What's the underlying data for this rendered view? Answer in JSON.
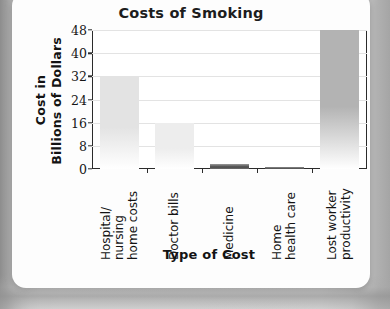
{
  "chart_data": {
    "type": "bar",
    "title": "Costs of Smoking",
    "xlabel": "Type of Cost",
    "ylabel_lines": [
      "Cost in",
      "Billions of Dollars"
    ],
    "ylabel": "Cost in Billions of Dollars",
    "categories": [
      "Hospital/ nursing home costs",
      "Doctor bills",
      "Medicine",
      "Home health care",
      "Lost worker productivity"
    ],
    "category_lines": [
      [
        "Hospital/",
        "nursing",
        "home costs"
      ],
      [
        "Doctor bills"
      ],
      [
        "Medicine"
      ],
      [
        "Home",
        "health care"
      ],
      [
        "Lost worker",
        "productivity"
      ]
    ],
    "values": [
      32,
      16,
      1.7,
      0.8,
      48
    ],
    "ylim": [
      0,
      48
    ],
    "yticks": [
      0,
      8,
      16,
      24,
      32,
      40,
      48
    ],
    "grid": true,
    "legend": "none",
    "bar_colors": [
      "#e3e3e3",
      "#ededed",
      "#777777",
      "#8a8a8a",
      "#b3b3b3"
    ]
  },
  "axis": {
    "tick_0": "0",
    "tick_8": "8",
    "tick_16": "16",
    "tick_24": "24",
    "tick_32": "32",
    "tick_40": "40",
    "tick_48": "48"
  }
}
